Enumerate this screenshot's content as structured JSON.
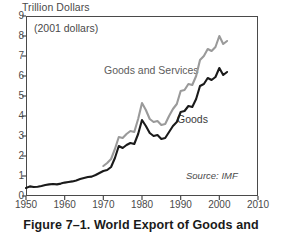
{
  "figure": {
    "caption": "Figure 7–1. World Export of Goods and",
    "source_note": "Source: IMF",
    "inplot_note": "(2001 dollars)",
    "axis_title": "Trillion Dollars"
  },
  "colors": {
    "goods_line": "#1a1a1a",
    "goods_and_services_line": "#9a9a9a",
    "frame": "#4a4a4a",
    "text": "#4a4a4a",
    "background": "#ffffff"
  },
  "chart_data": {
    "type": "line",
    "title": "Figure 7–1. World Export of Goods and",
    "xlabel": "",
    "ylabel": "Trillion Dollars",
    "annotation": "(2001 dollars)",
    "source": "Source: IMF",
    "grid": false,
    "legend_position": "inline-labels",
    "xlim": [
      1950,
      2010
    ],
    "ylim": [
      0,
      9
    ],
    "xticks": [
      1950,
      1960,
      1970,
      1980,
      1990,
      2000,
      2010
    ],
    "yticks": [
      0,
      1,
      2,
      3,
      4,
      5,
      6,
      7,
      8,
      9
    ],
    "xtick_labels": [
      "1950",
      "1960",
      "1970",
      "1980",
      "1990",
      "2000",
      "2010"
    ],
    "ytick_labels": [
      "0",
      "1",
      "2",
      "3",
      "4",
      "5",
      "6",
      "7",
      "8",
      "9"
    ],
    "series": [
      {
        "name": "Goods and Services",
        "color": "#9a9a9a",
        "x": [
          1970,
          1971,
          1972,
          1973,
          1974,
          1975,
          1976,
          1977,
          1978,
          1979,
          1980,
          1981,
          1982,
          1983,
          1984,
          1985,
          1986,
          1987,
          1988,
          1989,
          1990,
          1991,
          1992,
          1993,
          1994,
          1995,
          1996,
          1997,
          1998,
          1999,
          2000,
          2001,
          2002
        ],
        "values": [
          1.5,
          1.65,
          1.85,
          2.35,
          2.95,
          2.9,
          3.1,
          3.25,
          3.2,
          3.85,
          4.65,
          4.3,
          3.85,
          3.7,
          3.75,
          3.55,
          3.6,
          4.0,
          4.35,
          4.6,
          5.25,
          5.3,
          5.6,
          5.55,
          6.0,
          6.8,
          7.0,
          7.35,
          7.25,
          7.45,
          8.0,
          7.6,
          7.75
        ]
      },
      {
        "name": "Goods",
        "color": "#1a1a1a",
        "x": [
          1950,
          1951,
          1952,
          1953,
          1954,
          1955,
          1956,
          1957,
          1958,
          1959,
          1960,
          1961,
          1962,
          1963,
          1964,
          1965,
          1966,
          1967,
          1968,
          1969,
          1970,
          1971,
          1972,
          1973,
          1974,
          1975,
          1976,
          1977,
          1978,
          1979,
          1980,
          1981,
          1982,
          1983,
          1984,
          1985,
          1986,
          1987,
          1988,
          1989,
          1990,
          1991,
          1992,
          1993,
          1994,
          1995,
          1996,
          1997,
          1998,
          1999,
          2000,
          2001,
          2002
        ],
        "values": [
          0.4,
          0.48,
          0.45,
          0.46,
          0.5,
          0.55,
          0.58,
          0.6,
          0.58,
          0.62,
          0.67,
          0.7,
          0.73,
          0.78,
          0.85,
          0.9,
          0.95,
          0.97,
          1.05,
          1.15,
          1.25,
          1.3,
          1.45,
          1.9,
          2.5,
          2.4,
          2.55,
          2.65,
          2.6,
          3.1,
          3.8,
          3.5,
          3.15,
          3.0,
          3.05,
          2.85,
          2.9,
          3.2,
          3.5,
          3.7,
          4.2,
          4.25,
          4.5,
          4.45,
          4.85,
          5.5,
          5.6,
          5.9,
          5.8,
          5.95,
          6.4,
          6.05,
          6.2
        ]
      }
    ]
  }
}
